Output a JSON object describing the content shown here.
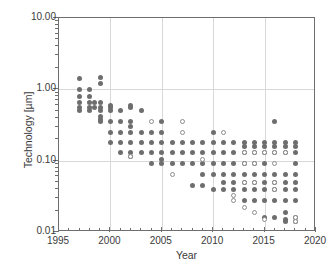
{
  "chart": {
    "type": "scatter",
    "title": "",
    "xlabel": "Year",
    "ylabel": "Technology [µm]",
    "y_axis_label_plain": "Technology [um]",
    "xlim": [
      1995,
      2020
    ],
    "ylim": [
      0.01,
      10.0
    ],
    "yscale": "log",
    "xscale": "linear",
    "grid": true,
    "legend": "none",
    "x_ticks": [
      "1995",
      "2000",
      "2005",
      "2010",
      "2015",
      "2020"
    ],
    "x_tick_values": [
      1995,
      2000,
      2005,
      2010,
      2015,
      2020
    ],
    "x_minor_step": 1,
    "y_ticks": [
      "10.00",
      "1.00",
      "0.10",
      "0.01"
    ],
    "y_tick_values": [
      10.0,
      1.0,
      0.1,
      0.01
    ],
    "marker_colors": {
      "filled": "#6e6e6e",
      "open_edge": "#8c8c8c",
      "open_fill": "#ffffff",
      "grid": "#d8d8d8",
      "frame": "#6e6e6e",
      "text": "#3a3a3a"
    },
    "series": [
      {
        "name": "filled",
        "marker": "filled-circle",
        "points": [
          [
            1997,
            1.4
          ],
          [
            1997,
            1.0
          ],
          [
            1997,
            0.8
          ],
          [
            1997,
            0.65
          ],
          [
            1997,
            0.55
          ],
          [
            1997,
            0.5
          ],
          [
            1998,
            1.0
          ],
          [
            1998,
            0.8
          ],
          [
            1998,
            0.65
          ],
          [
            1998,
            0.55
          ],
          [
            1998,
            0.5
          ],
          [
            1998.5,
            0.65
          ],
          [
            1998.5,
            0.55
          ],
          [
            1999,
            1.45
          ],
          [
            1999,
            1.2
          ],
          [
            1999,
            0.65
          ],
          [
            1999,
            0.55
          ],
          [
            1999,
            0.5
          ],
          [
            1999,
            0.42
          ],
          [
            1999,
            0.38
          ],
          [
            1999,
            0.35
          ],
          [
            2000,
            0.6
          ],
          [
            2000,
            0.55
          ],
          [
            2000,
            0.5
          ],
          [
            2000,
            0.35
          ],
          [
            2000,
            0.25
          ],
          [
            2000,
            0.18
          ],
          [
            2001,
            0.5
          ],
          [
            2001,
            0.35
          ],
          [
            2001,
            0.25
          ],
          [
            2001,
            0.18
          ],
          [
            2001,
            0.13
          ],
          [
            2002,
            0.6
          ],
          [
            2002,
            0.55
          ],
          [
            2002,
            0.35
          ],
          [
            2002,
            0.3
          ],
          [
            2002,
            0.25
          ],
          [
            2002,
            0.18
          ],
          [
            2002,
            0.13
          ],
          [
            2002,
            0.115
          ],
          [
            2003,
            0.5
          ],
          [
            2003,
            0.25
          ],
          [
            2003,
            0.18
          ],
          [
            2003,
            0.13
          ],
          [
            2004,
            0.25
          ],
          [
            2004,
            0.18
          ],
          [
            2004,
            0.13
          ],
          [
            2004,
            0.09
          ],
          [
            2005,
            0.35
          ],
          [
            2005,
            0.25
          ],
          [
            2005,
            0.18
          ],
          [
            2005,
            0.13
          ],
          [
            2005,
            0.105
          ],
          [
            2005,
            0.09
          ],
          [
            2006,
            0.18
          ],
          [
            2006,
            0.13
          ],
          [
            2006,
            0.09
          ],
          [
            2007,
            0.18
          ],
          [
            2007,
            0.13
          ],
          [
            2007,
            0.09
          ],
          [
            2008,
            0.18
          ],
          [
            2008,
            0.13
          ],
          [
            2008,
            0.09
          ],
          [
            2008,
            0.045
          ],
          [
            2009,
            0.18
          ],
          [
            2009,
            0.13
          ],
          [
            2009,
            0.09
          ],
          [
            2009,
            0.065
          ],
          [
            2009,
            0.045
          ],
          [
            2010,
            0.25
          ],
          [
            2010,
            0.18
          ],
          [
            2010,
            0.13
          ],
          [
            2010,
            0.09
          ],
          [
            2010,
            0.065
          ],
          [
            2010,
            0.04
          ],
          [
            2011,
            0.18
          ],
          [
            2011,
            0.13
          ],
          [
            2011,
            0.09
          ],
          [
            2011,
            0.065
          ],
          [
            2011,
            0.05
          ],
          [
            2011,
            0.04
          ],
          [
            2012,
            0.18
          ],
          [
            2012,
            0.13
          ],
          [
            2012,
            0.09
          ],
          [
            2012,
            0.065
          ],
          [
            2012,
            0.05
          ],
          [
            2012,
            0.04
          ],
          [
            2013,
            0.18
          ],
          [
            2013,
            0.16
          ],
          [
            2013,
            0.13
          ],
          [
            2013,
            0.09
          ],
          [
            2013,
            0.065
          ],
          [
            2013,
            0.05
          ],
          [
            2013,
            0.04
          ],
          [
            2013,
            0.028
          ],
          [
            2014,
            0.18
          ],
          [
            2014,
            0.16
          ],
          [
            2014,
            0.13
          ],
          [
            2014,
            0.09
          ],
          [
            2014,
            0.065
          ],
          [
            2014,
            0.05
          ],
          [
            2014,
            0.04
          ],
          [
            2014,
            0.028
          ],
          [
            2015,
            0.18
          ],
          [
            2015,
            0.16
          ],
          [
            2015,
            0.13
          ],
          [
            2015,
            0.09
          ],
          [
            2015,
            0.065
          ],
          [
            2015,
            0.05
          ],
          [
            2015,
            0.04
          ],
          [
            2015,
            0.028
          ],
          [
            2015,
            0.016
          ],
          [
            2016,
            0.35
          ],
          [
            2016,
            0.18
          ],
          [
            2016,
            0.16
          ],
          [
            2016,
            0.13
          ],
          [
            2016,
            0.065
          ],
          [
            2016,
            0.05
          ],
          [
            2016,
            0.04
          ],
          [
            2016,
            0.028
          ],
          [
            2016,
            0.016
          ],
          [
            2017,
            0.18
          ],
          [
            2017,
            0.16
          ],
          [
            2017,
            0.13
          ],
          [
            2017,
            0.065
          ],
          [
            2017,
            0.05
          ],
          [
            2017,
            0.04
          ],
          [
            2017,
            0.028
          ],
          [
            2017,
            0.019
          ],
          [
            2017,
            0.015
          ],
          [
            2017,
            0.014
          ],
          [
            2018,
            0.18
          ],
          [
            2018,
            0.16
          ],
          [
            2018,
            0.13
          ],
          [
            2018,
            0.09
          ],
          [
            2018,
            0.065
          ],
          [
            2018,
            0.05
          ],
          [
            2018,
            0.04
          ],
          [
            2018,
            0.028
          ],
          [
            2018,
            0.016
          ],
          [
            2018,
            0.014
          ]
        ]
      },
      {
        "name": "open",
        "marker": "open-circle",
        "points": [
          [
            2002,
            0.115
          ],
          [
            2004,
            0.35
          ],
          [
            2006,
            0.065
          ],
          [
            2007,
            0.35
          ],
          [
            2007,
            0.25
          ],
          [
            2009,
            0.105
          ],
          [
            2011,
            0.25
          ],
          [
            2012,
            0.033
          ],
          [
            2012,
            0.028
          ],
          [
            2013,
            0.13
          ],
          [
            2013,
            0.09
          ],
          [
            2013,
            0.05
          ],
          [
            2013,
            0.022
          ],
          [
            2014,
            0.13
          ],
          [
            2014,
            0.09
          ],
          [
            2014,
            0.05
          ],
          [
            2014,
            0.019
          ],
          [
            2015,
            0.13
          ],
          [
            2015,
            0.015
          ],
          [
            2016,
            0.13
          ],
          [
            2016,
            0.09
          ],
          [
            2016,
            0.05
          ],
          [
            2016,
            0.04
          ],
          [
            2017,
            0.13
          ],
          [
            2018,
            0.016
          ],
          [
            2018,
            0.014
          ]
        ]
      }
    ]
  }
}
